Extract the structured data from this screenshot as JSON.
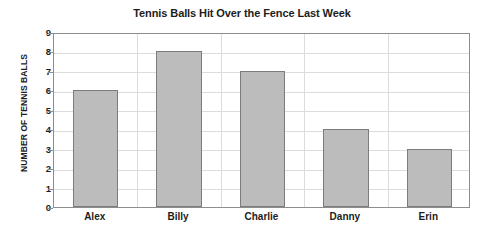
{
  "chart_data": {
    "type": "bar",
    "title": "Tennis Balls Hit Over the Fence Last Week",
    "xlabel": "",
    "ylabel": "NUMBER OF TENNIS BALLS",
    "categories": [
      "Alex",
      "Billy",
      "Charlie",
      "Danny",
      "Erin"
    ],
    "values": [
      6,
      8,
      7,
      4,
      3
    ],
    "ylim": [
      0,
      9
    ],
    "ytick_labels": [
      "0",
      "1",
      "2",
      "3",
      "4",
      "5",
      "6",
      "7",
      "8",
      "9"
    ],
    "ytick_values": [
      0,
      1,
      2,
      3,
      4,
      5,
      6,
      7,
      8,
      9
    ],
    "grid": true,
    "legend": false,
    "bar_fill_color": "#bcbcbc",
    "bar_border_color": "#7c7c7c",
    "gridline_color": "#dcdcdc",
    "axis_color": "#8d8d8d",
    "background_color": "#ffffff",
    "text_color": "#1d1d1d"
  }
}
